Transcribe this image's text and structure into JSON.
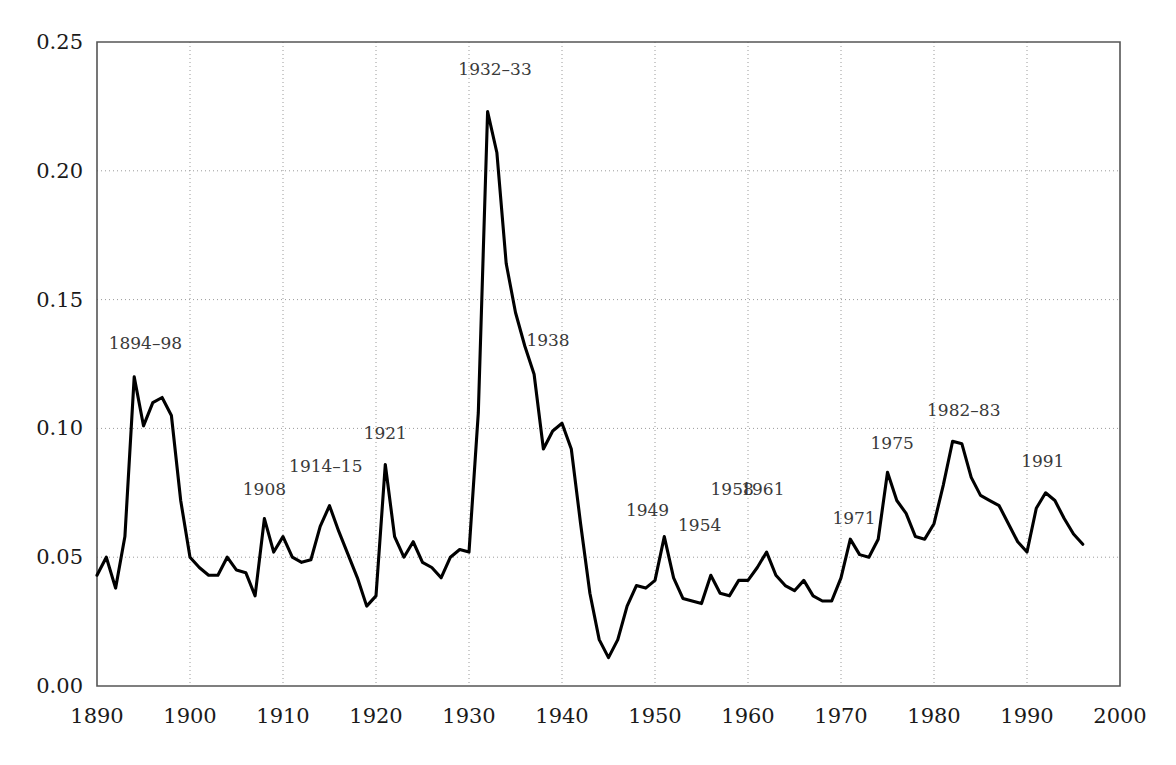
{
  "chart_data": {
    "type": "line",
    "title": "",
    "subtitle": "",
    "xlabel": "",
    "ylabel": "",
    "xlim": [
      1890,
      2000
    ],
    "ylim": [
      0.0,
      0.25
    ],
    "grid": true,
    "legend": "none",
    "x_ticks": [
      "1890",
      "1900",
      "1910",
      "1920",
      "1930",
      "1940",
      "1950",
      "1960",
      "1970",
      "1980",
      "1990",
      "2000"
    ],
    "x_tick_values": [
      1890,
      1900,
      1910,
      1920,
      1930,
      1940,
      1950,
      1960,
      1970,
      1980,
      1990,
      2000
    ],
    "y_ticks": [
      "0.00",
      "0.05",
      "0.10",
      "0.15",
      "0.20",
      "0.25"
    ],
    "y_tick_values": [
      0.0,
      0.05,
      0.1,
      0.15,
      0.2,
      0.25
    ],
    "series": [
      {
        "name": "series-1",
        "color": "#000000",
        "x": [
          1890,
          1891,
          1892,
          1893,
          1894,
          1895,
          1896,
          1897,
          1898,
          1899,
          1900,
          1901,
          1902,
          1903,
          1904,
          1905,
          1906,
          1907,
          1908,
          1909,
          1910,
          1911,
          1912,
          1913,
          1914,
          1915,
          1916,
          1917,
          1918,
          1919,
          1920,
          1921,
          1922,
          1923,
          1924,
          1925,
          1926,
          1927,
          1928,
          1929,
          1930,
          1931,
          1932,
          1933,
          1934,
          1935,
          1936,
          1937,
          1938,
          1939,
          1940,
          1941,
          1942,
          1943,
          1944,
          1945,
          1946,
          1947,
          1948,
          1949,
          1950,
          1951,
          1952,
          1953,
          1954,
          1955,
          1956,
          1957,
          1958,
          1959,
          1960,
          1961,
          1962,
          1963,
          1964,
          1965,
          1966,
          1967,
          1968,
          1969,
          1970,
          1971,
          1972,
          1973,
          1974,
          1975,
          1976,
          1977,
          1978,
          1979,
          1980,
          1981,
          1982,
          1983,
          1984,
          1985,
          1986,
          1987,
          1988,
          1989,
          1990,
          1991,
          1992,
          1993,
          1994,
          1995,
          1996
        ],
        "y": [
          0.043,
          0.05,
          0.038,
          0.058,
          0.12,
          0.101,
          0.11,
          0.112,
          0.105,
          0.072,
          0.05,
          0.046,
          0.043,
          0.043,
          0.05,
          0.045,
          0.044,
          0.035,
          0.065,
          0.052,
          0.058,
          0.05,
          0.048,
          0.049,
          0.062,
          0.07,
          0.06,
          0.051,
          0.042,
          0.031,
          0.035,
          0.086,
          0.058,
          0.05,
          0.056,
          0.048,
          0.046,
          0.042,
          0.05,
          0.053,
          0.052,
          0.106,
          0.223,
          0.207,
          0.164,
          0.145,
          0.132,
          0.121,
          0.092,
          0.099,
          0.102,
          0.092,
          0.063,
          0.036,
          0.018,
          0.011,
          0.018,
          0.031,
          0.039,
          0.038,
          0.041,
          0.058,
          0.042,
          0.034,
          0.033,
          0.032,
          0.043,
          0.036,
          0.035,
          0.041,
          0.041,
          0.046,
          0.052,
          0.043,
          0.039,
          0.037,
          0.041,
          0.035,
          0.033,
          0.033,
          0.042,
          0.057,
          0.051,
          0.05,
          0.057,
          0.083,
          0.072,
          0.067,
          0.058,
          0.057,
          0.063,
          0.078,
          0.095,
          0.094,
          0.081,
          0.074,
          0.072,
          0.07,
          0.063,
          0.056,
          0.052,
          0.069,
          0.075,
          0.072,
          0.065,
          0.059,
          0.055
        ]
      }
    ],
    "annotations": [
      {
        "label": "1894–98",
        "x": 1895.2,
        "y": 0.131
      },
      {
        "label": "1908",
        "x": 1908.0,
        "y": 0.074
      },
      {
        "label": "1914–15",
        "x": 1914.6,
        "y": 0.083
      },
      {
        "label": "1921",
        "x": 1921.0,
        "y": 0.096
      },
      {
        "label": "1932–33",
        "x": 1932.8,
        "y": 0.237
      },
      {
        "label": "1938",
        "x": 1938.5,
        "y": 0.132
      },
      {
        "label": "1949",
        "x": 1949.2,
        "y": 0.066
      },
      {
        "label": "1954",
        "x": 1954.8,
        "y": 0.06
      },
      {
        "label": "1958",
        "x": 1958.3,
        "y": 0.074
      },
      {
        "label": "1961",
        "x": 1961.6,
        "y": 0.074
      },
      {
        "label": "1971",
        "x": 1971.4,
        "y": 0.063
      },
      {
        "label": "1975",
        "x": 1975.5,
        "y": 0.092
      },
      {
        "label": "1982–83",
        "x": 1983.2,
        "y": 0.105
      },
      {
        "label": "1991",
        "x": 1991.7,
        "y": 0.085
      }
    ]
  },
  "axes": {
    "plot_left_px": 97,
    "plot_right_px": 1120,
    "plot_top_px": 42,
    "plot_bottom_px": 686
  }
}
